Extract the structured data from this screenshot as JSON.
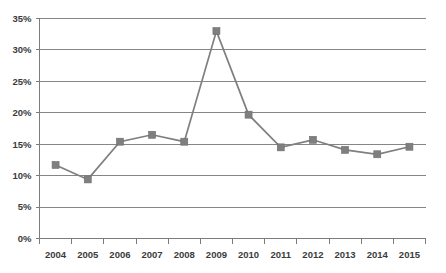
{
  "chart_data": {
    "type": "line",
    "title": "",
    "subtitle": "",
    "xlabel": "",
    "ylabel": "",
    "categories": [
      "2004",
      "2005",
      "2006",
      "2007",
      "2008",
      "2009",
      "2010",
      "2011",
      "2012",
      "2013",
      "2014",
      "2015"
    ],
    "values": [
      11.7,
      9.4,
      15.4,
      16.5,
      15.4,
      33.0,
      19.7,
      14.5,
      15.7,
      14.1,
      13.4,
      14.6
    ],
    "series": [
      {
        "name": "",
        "values": [
          11.7,
          9.4,
          15.4,
          16.5,
          15.4,
          33.0,
          19.7,
          14.5,
          15.7,
          14.1,
          13.4,
          14.6
        ]
      }
    ],
    "ylim": [
      0,
      35
    ],
    "ytick_labels": [
      "0%",
      "5%",
      "10%",
      "15%",
      "20%",
      "25%",
      "30%",
      "35%"
    ],
    "ytick_values": [
      0,
      5,
      10,
      15,
      20,
      25,
      30,
      35
    ],
    "xtick_labels": [
      "2004",
      "2005",
      "2006",
      "2007",
      "2008",
      "2009",
      "2010",
      "2011",
      "2012",
      "2013",
      "2014",
      "2015"
    ],
    "grid": "horizontal",
    "legend": "none",
    "marker": "square",
    "colors": {
      "line": "#7f7f7f",
      "marker": "#7f7f7f",
      "gridline": "#868686",
      "axis": "#7c7c7c",
      "text": "#3b3b3b",
      "background": "#ffffff"
    }
  }
}
